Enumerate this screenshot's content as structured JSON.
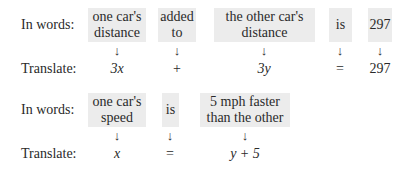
{
  "rows": [
    {
      "words_label": "In words:",
      "translate_label": "Translate:",
      "phrases": [
        {
          "line1": "one car's",
          "line2": "distance",
          "translation": "3x",
          "italic": true
        },
        {
          "line1": "added",
          "line2": "to",
          "translation": "+",
          "italic": false
        },
        {
          "line1": "the other car's",
          "line2": "distance",
          "translation": "3y",
          "italic": true
        },
        {
          "line1": "is",
          "line2": "",
          "translation": "=",
          "italic": false
        },
        {
          "line1": "297",
          "line2": "",
          "translation": "297",
          "italic": false
        }
      ]
    },
    {
      "words_label": "In words:",
      "translate_label": "Translate:",
      "phrases": [
        {
          "line1": "one car's",
          "line2": "speed",
          "translation": "x",
          "italic": true
        },
        {
          "line1": "is",
          "line2": "",
          "translation": "=",
          "italic": false
        },
        {
          "line1": "5 mph faster",
          "line2": "than the other",
          "translation": "y + 5",
          "italic": true
        }
      ]
    }
  ],
  "arrow_glyph": "↓",
  "box_color": "#ececec"
}
